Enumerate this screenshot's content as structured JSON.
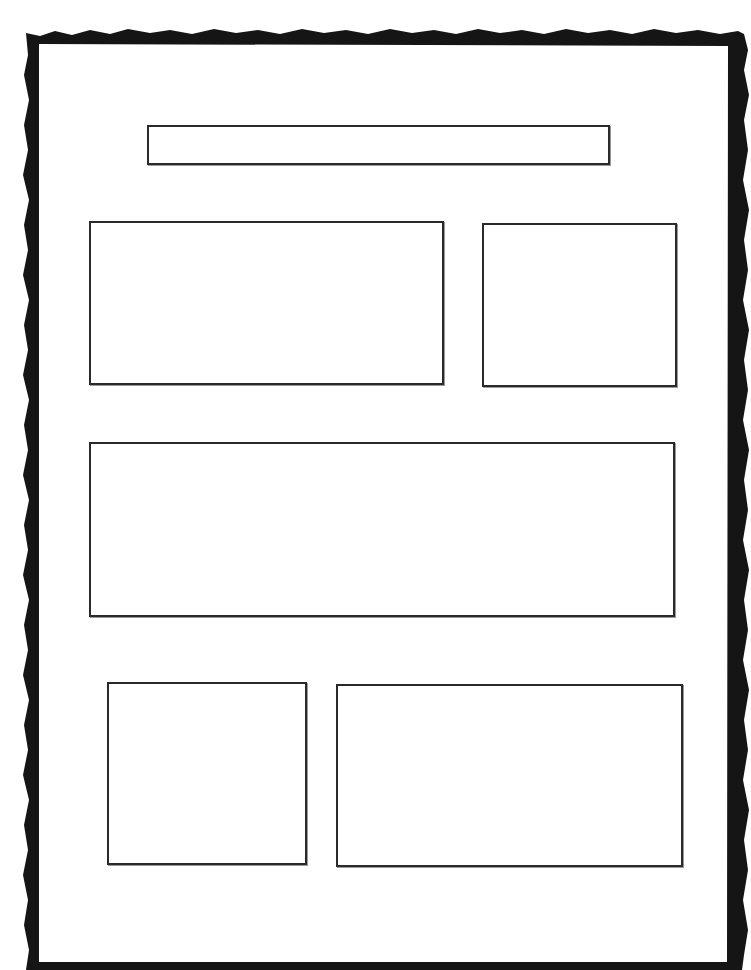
{
  "page": {
    "background": "#ffffff",
    "frame_color": "#151515",
    "box_border_color": "#2a2a2a"
  },
  "boxes": [
    {
      "name": "title-box",
      "text": ""
    },
    {
      "name": "box-top-left",
      "text": ""
    },
    {
      "name": "box-top-right",
      "text": ""
    },
    {
      "name": "box-middle-wide",
      "text": ""
    },
    {
      "name": "box-bottom-left",
      "text": ""
    },
    {
      "name": "box-bottom-right",
      "text": ""
    }
  ]
}
